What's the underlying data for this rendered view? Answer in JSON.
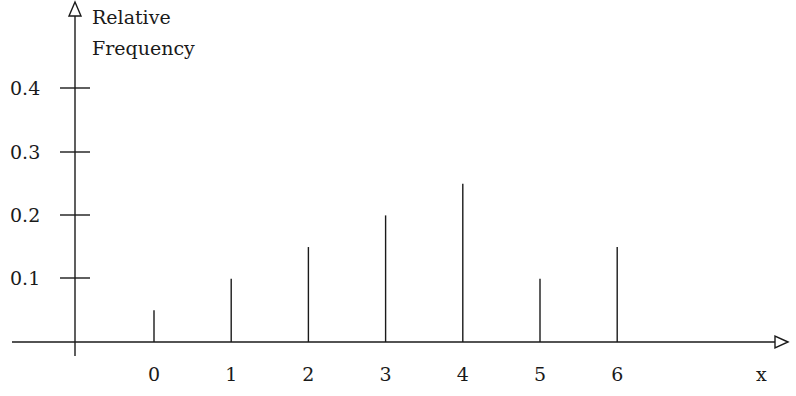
{
  "chart_data": {
    "type": "bar",
    "style": "spike",
    "title": "",
    "xlabel": "x",
    "ylabel": "Relative Frequency",
    "ylabel_lines": [
      "Relative",
      "Frequency"
    ],
    "categories": [
      "0",
      "1",
      "2",
      "3",
      "4",
      "5",
      "6"
    ],
    "values": [
      0.05,
      0.1,
      0.15,
      0.2,
      0.25,
      0.1,
      0.15
    ],
    "y_ticks": [
      "0.1",
      "0.2",
      "0.3",
      "0.4"
    ],
    "y_tick_values": [
      0.1,
      0.2,
      0.3,
      0.4
    ],
    "x_ticks": [
      "0",
      "1",
      "2",
      "3",
      "4",
      "5",
      "6"
    ],
    "ylim": [
      0,
      0.42
    ],
    "grid": false,
    "legend": null,
    "line_color": "#1a1a1a"
  }
}
